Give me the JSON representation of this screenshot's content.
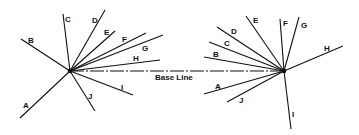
{
  "diagram": {
    "base_line_label": "Base Line",
    "base_line": {
      "x1": 70,
      "y1": 71,
      "x2": 284,
      "y2": 71
    },
    "left_pivot": {
      "x": 70,
      "y": 71
    },
    "right_pivot": {
      "x": 284,
      "y": 71
    },
    "left_rays": [
      {
        "label": "A",
        "x": 20,
        "y": 118,
        "lx": 23,
        "ly": 108
      },
      {
        "label": "B",
        "x": 21,
        "y": 39,
        "lx": 28,
        "ly": 43
      },
      {
        "label": "C",
        "x": 63,
        "y": 14,
        "lx": 65,
        "ly": 22
      },
      {
        "label": "D",
        "x": 105,
        "y": 10,
        "lx": 92,
        "ly": 23
      },
      {
        "label": "E",
        "x": 115,
        "y": 31,
        "lx": 104,
        "ly": 35
      },
      {
        "label": "F",
        "x": 146,
        "y": 33,
        "lx": 122,
        "ly": 42
      },
      {
        "label": "G",
        "x": 163,
        "y": 35,
        "lx": 142,
        "ly": 51
      },
      {
        "label": "H",
        "x": 160,
        "y": 60,
        "lx": 133,
        "ly": 61
      },
      {
        "label": "I",
        "x": 133,
        "y": 95,
        "lx": 121,
        "ly": 90
      },
      {
        "label": "J",
        "x": 95,
        "y": 111,
        "lx": 88,
        "ly": 99
      }
    ],
    "right_rays": [
      {
        "label": "A",
        "x": 204,
        "y": 94,
        "lx": 215,
        "ly": 89
      },
      {
        "label": "B",
        "x": 204,
        "y": 57,
        "lx": 213,
        "ly": 57
      },
      {
        "label": "C",
        "x": 209,
        "y": 42,
        "lx": 224,
        "ly": 46
      },
      {
        "label": "D",
        "x": 217,
        "y": 27,
        "lx": 231,
        "ly": 34
      },
      {
        "label": "E",
        "x": 246,
        "y": 16,
        "lx": 253,
        "ly": 23
      },
      {
        "label": "F",
        "x": 280,
        "y": 19,
        "lx": 283,
        "ly": 26
      },
      {
        "label": "G",
        "x": 299,
        "y": 17,
        "lx": 301,
        "ly": 28
      },
      {
        "label": "H",
        "x": 343,
        "y": 46,
        "lx": 324,
        "ly": 51
      },
      {
        "label": "I",
        "x": 291,
        "y": 129,
        "lx": 292,
        "ly": 117
      },
      {
        "label": "J",
        "x": 227,
        "y": 102,
        "lx": 239,
        "ly": 103
      }
    ]
  }
}
